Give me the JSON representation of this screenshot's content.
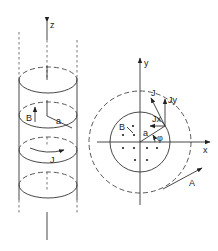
{
  "figure": {
    "left_panel": {
      "description": "Solenoid cylinder with axial field B and azimuthal current J",
      "labels": {
        "z_axis": "z",
        "field": "B",
        "radius": "a",
        "current": "J"
      }
    },
    "right_panel": {
      "description": "Cross-section in x-y plane showing field B (dots), current density J components, radius a, angle phi, and vector potential A",
      "labels": {
        "x_axis": "x",
        "y_axis": "y",
        "field": "B",
        "radius": "a",
        "angle": "φ",
        "current": "J",
        "current_x": "Jx",
        "current_y": "Jy",
        "vector_potential": "A"
      }
    }
  }
}
